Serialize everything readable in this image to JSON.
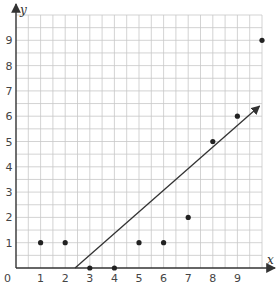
{
  "chart_data": {
    "type": "scatter",
    "title": "",
    "xlabel": "x",
    "ylabel": "y",
    "xlim": [
      0,
      10
    ],
    "ylim": [
      0,
      10
    ],
    "grid": true,
    "grid_minor_step": 0.5,
    "x_ticks": [
      "0",
      "1",
      "2",
      "3",
      "4",
      "5",
      "6",
      "7",
      "8",
      "9"
    ],
    "y_ticks": [
      "1",
      "2",
      "3",
      "4",
      "5",
      "6",
      "7",
      "8",
      "9"
    ],
    "series": [
      {
        "name": "data points",
        "points": [
          {
            "x": 1,
            "y": 1
          },
          {
            "x": 2,
            "y": 1
          },
          {
            "x": 3,
            "y": 0
          },
          {
            "x": 4,
            "y": 0
          },
          {
            "x": 5,
            "y": 1
          },
          {
            "x": 6,
            "y": 1
          },
          {
            "x": 7,
            "y": 2
          },
          {
            "x": 8,
            "y": 5
          },
          {
            "x": 9,
            "y": 6
          },
          {
            "x": 10,
            "y": 9
          }
        ]
      }
    ],
    "fit_line": {
      "type": "ray",
      "start": {
        "x": 2.4,
        "y": 0
      },
      "end": {
        "x": 9.9,
        "y": 6.4
      }
    },
    "colors": {
      "grid": "#c8c8c8",
      "axis": "#333333",
      "points": "#222222",
      "line": "#333333"
    }
  }
}
